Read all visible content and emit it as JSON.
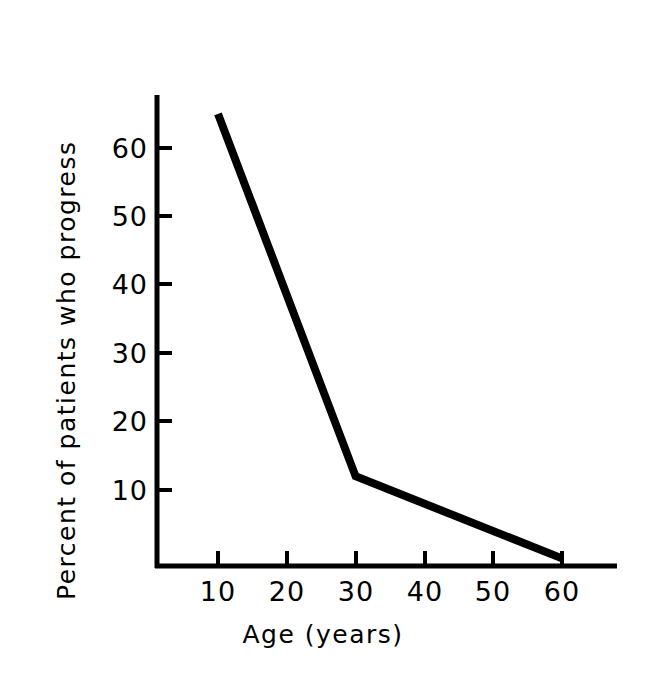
{
  "chart_data": {
    "type": "line",
    "title": "",
    "subtitle": "",
    "xlabel": "Age (years)",
    "ylabel": "Percent of patients who progress",
    "x": [
      10,
      30,
      60
    ],
    "values": [
      65,
      12,
      0
    ],
    "series": [
      {
        "name": "Percent of patients who progress",
        "x": [
          10,
          30,
          60
        ],
        "values": [
          65,
          12,
          0
        ]
      }
    ],
    "xlim": [
      0,
      68
    ],
    "ylim": [
      0,
      68
    ],
    "xticks": [
      10,
      20,
      30,
      40,
      50,
      60
    ],
    "yticks": [
      10,
      20,
      30,
      40,
      50,
      60
    ],
    "xtick_labels": [
      "10",
      "20",
      "30",
      "40",
      "50",
      "60"
    ],
    "ytick_labels": [
      "10",
      "20",
      "30",
      "40",
      "50",
      "60"
    ],
    "grid": false,
    "legend": "none",
    "line_color": "#000000",
    "background_color": "#ffffff",
    "annotations": []
  },
  "axes": {
    "x_title": "Age (years)",
    "y_title": "Percent of patients who progress"
  },
  "ticks": {
    "y": {
      "t60": "60",
      "t50": "50",
      "t40": "40",
      "t30": "30",
      "t20": "20",
      "t10": "10"
    },
    "x": {
      "t10": "10",
      "t20": "20",
      "t30": "30",
      "t40": "40",
      "t50": "50",
      "t60": "60"
    }
  }
}
